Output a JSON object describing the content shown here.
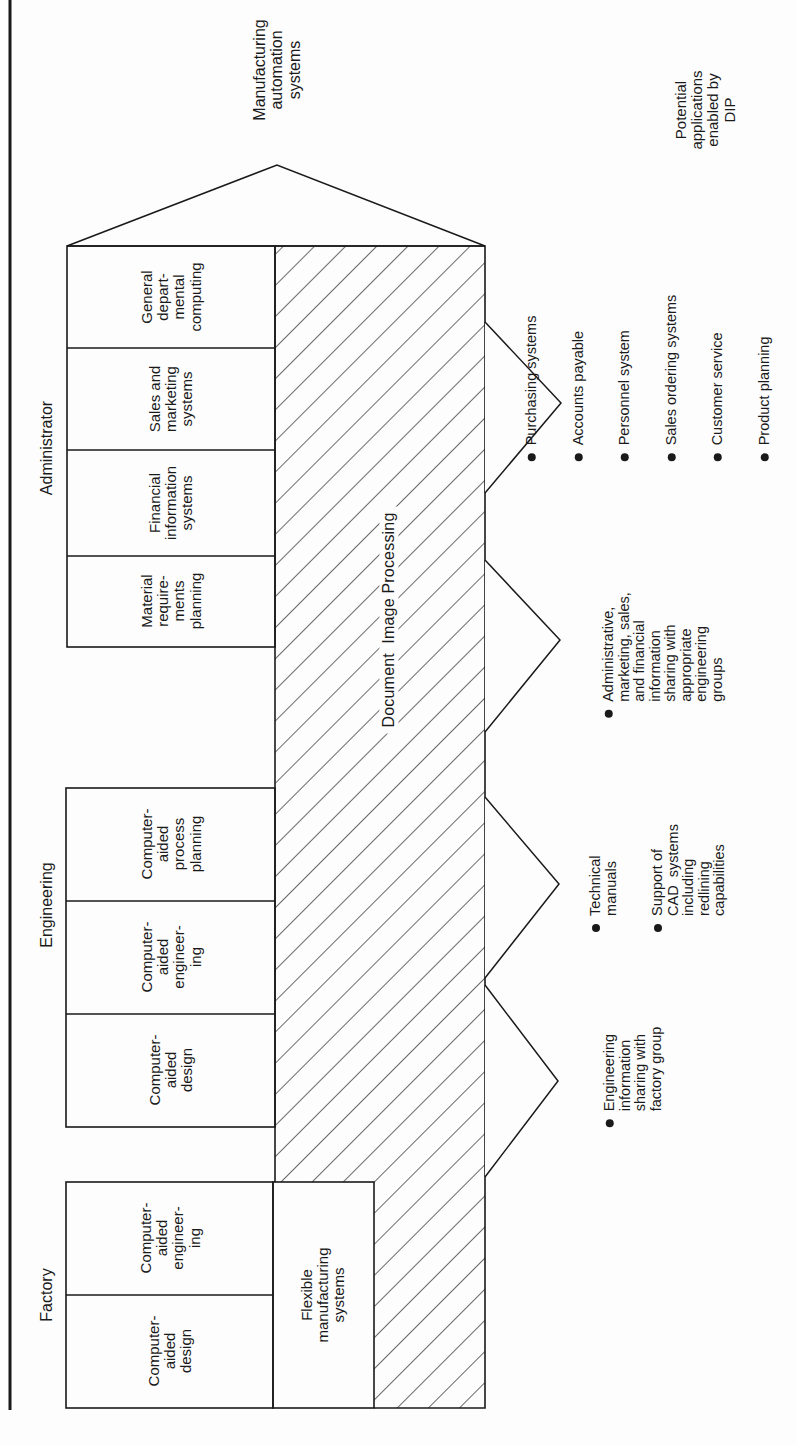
{
  "colors": {
    "ink": "#1a1a1a",
    "paper": "#fdfdfd"
  },
  "top_label": "Manufacturing\nautomation\nsystems",
  "right_caption": "Potential\napplications\nenabled by\nDIP",
  "dip_band_label": "Document  Image Processing",
  "groups": [
    {
      "name": "Administrator",
      "boxes": [
        {
          "label": "General\ndepart-\nmental\ncomputing"
        },
        {
          "label": "Sales and\nmarketing\nsystems"
        },
        {
          "label": "Financial\ninformation\nsystems"
        },
        {
          "label": "Material\nrequire-\nments\nplanning"
        }
      ]
    },
    {
      "name": "Engineering",
      "boxes": [
        {
          "label": "Computer-\naided\nprocess\nplanning"
        },
        {
          "label": "Computer-\naided\nengineer-\ning"
        },
        {
          "label": "Computer-\naided\ndesign"
        }
      ]
    },
    {
      "name": "Factory",
      "boxes": [
        {
          "label": "Computer-\naided\nengineer-\ning"
        },
        {
          "label": "Computer-\naided\ndesign"
        }
      ],
      "extra_box": {
        "label": "Flexible\nmanufacturing\nsystems"
      }
    }
  ],
  "applications": [
    {
      "items": [
        "Purchasing systems",
        "Accounts payable",
        "Personnel system",
        "Sales ordering systems",
        "Customer service",
        "Product planning"
      ]
    },
    {
      "items": [
        "Administrative,\nmarketing, sales,\nand financial\ninformation\nsharing with\nappropriate\nengineering\ngroups"
      ]
    },
    {
      "items": [
        "Technical\nmanuals",
        "Support of\nCAD  systems\nincluding\nredlining\ncapabilities"
      ]
    },
    {
      "items": [
        "Engineering\ninformation\nsharing with\nfactory group"
      ]
    }
  ]
}
